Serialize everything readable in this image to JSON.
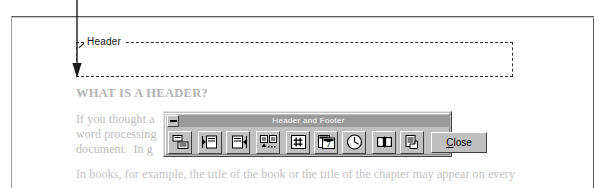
{
  "document": {
    "header_region_label": "Header",
    "heading": "WHAT IS A HEADER?",
    "paragraph_1_line_1": "If you thought a                                      in. In",
    "paragraph_1_line_2": "word processing                                     of a",
    "paragraph_1_line_3": "document.  In g",
    "paragraph_2": "In books, for example, the title of the book or the title of the chapter may appear on every"
  },
  "toolbar": {
    "title": "Header and Footer",
    "system_menu_icon": "system-menu-icon",
    "close_label": "Close",
    "close_accel": "C",
    "buttons": [
      {
        "name": "switch-between-header-and-footer",
        "icon": "switch-header-footer-icon",
        "tooltip": "Switch Between Header and Footer"
      },
      {
        "name": "show-previous",
        "icon": "show-previous-icon",
        "tooltip": "Show Previous"
      },
      {
        "name": "show-next",
        "icon": "show-next-icon",
        "tooltip": "Show Next"
      },
      {
        "name": "same-as-previous",
        "icon": "same-as-previous-icon",
        "tooltip": "Same as Previous"
      },
      {
        "name": "insert-page-number",
        "icon": "page-number-hash-icon",
        "tooltip": "Insert Page Number"
      },
      {
        "name": "insert-date",
        "icon": "calendar-date-icon",
        "tooltip": "Insert Date"
      },
      {
        "name": "insert-time",
        "icon": "clock-time-icon",
        "tooltip": "Insert Time"
      },
      {
        "name": "page-setup",
        "icon": "open-book-page-setup-icon",
        "tooltip": "Page Setup"
      },
      {
        "name": "show-hide-document-text",
        "icon": "document-text-toggle-icon",
        "tooltip": "Show/Hide Document Text"
      }
    ]
  },
  "callout": {
    "name": "header-area-pointer-arrow"
  },
  "colors": {
    "chrome_face": "#c0c0c0",
    "chrome_shadow": "#404040",
    "chrome_light": "#ffffff",
    "titlebar": "#9a9a9a",
    "doc_text": "#bcbcbc",
    "dash_border": "#2b2b2b"
  }
}
